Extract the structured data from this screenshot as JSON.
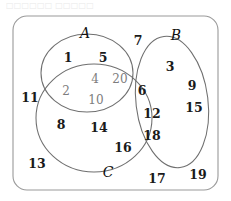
{
  "header": {
    "top_text": "□□□□□□ □□□□□"
  },
  "diagram": {
    "type": "venn-3-set",
    "title": "",
    "universe_label": "",
    "set_labels": [
      {
        "id": "A",
        "text": "A",
        "x": 85,
        "y": 33
      },
      {
        "id": "B",
        "text": "B",
        "x": 176,
        "y": 35
      },
      {
        "id": "C",
        "text": "C",
        "x": 108,
        "y": 172
      }
    ],
    "colors": {
      "outline": "#8c8c8c",
      "ellipse_stroke": "#6f6f6f",
      "element_text": "#1a1a1a",
      "faint_text": "#7d7d7d",
      "background": "#ffffff"
    },
    "elements": [
      {
        "value": "1",
        "x": 68,
        "y": 57,
        "region": "A-only",
        "faint": false
      },
      {
        "value": "5",
        "x": 103,
        "y": 57,
        "region": "A-only",
        "faint": false
      },
      {
        "value": "7",
        "x": 138,
        "y": 40,
        "region": "U-only",
        "faint": false
      },
      {
        "value": "3",
        "x": 170,
        "y": 66,
        "region": "B-only",
        "faint": false
      },
      {
        "value": "9",
        "x": 192,
        "y": 85,
        "region": "B-only",
        "faint": false
      },
      {
        "value": "15",
        "x": 194,
        "y": 107,
        "region": "B-only",
        "faint": false
      },
      {
        "value": "4",
        "x": 95,
        "y": 79,
        "region": "A-and-C",
        "faint": true
      },
      {
        "value": "20",
        "x": 120,
        "y": 79,
        "region": "A-and-C",
        "faint": true
      },
      {
        "value": "2",
        "x": 66,
        "y": 91,
        "region": "A-and-C",
        "faint": true
      },
      {
        "value": "10",
        "x": 96,
        "y": 100,
        "region": "A-and-C",
        "faint": true
      },
      {
        "value": "11",
        "x": 30,
        "y": 97,
        "region": "U-only",
        "faint": false
      },
      {
        "value": "6",
        "x": 142,
        "y": 90,
        "region": "B-and-C",
        "faint": false
      },
      {
        "value": "12",
        "x": 152,
        "y": 113,
        "region": "B-and-C",
        "faint": false
      },
      {
        "value": "18",
        "x": 152,
        "y": 135,
        "region": "B-and-C",
        "faint": false
      },
      {
        "value": "8",
        "x": 61,
        "y": 124,
        "region": "C-only",
        "faint": false
      },
      {
        "value": "14",
        "x": 99,
        "y": 127,
        "region": "C-only",
        "faint": false
      },
      {
        "value": "16",
        "x": 123,
        "y": 147,
        "region": "C-only",
        "faint": false
      },
      {
        "value": "13",
        "x": 37,
        "y": 163,
        "region": "U-only",
        "faint": false
      },
      {
        "value": "17",
        "x": 157,
        "y": 178,
        "region": "U-only",
        "faint": false
      },
      {
        "value": "19",
        "x": 198,
        "y": 174,
        "region": "U-only",
        "faint": false
      }
    ]
  }
}
